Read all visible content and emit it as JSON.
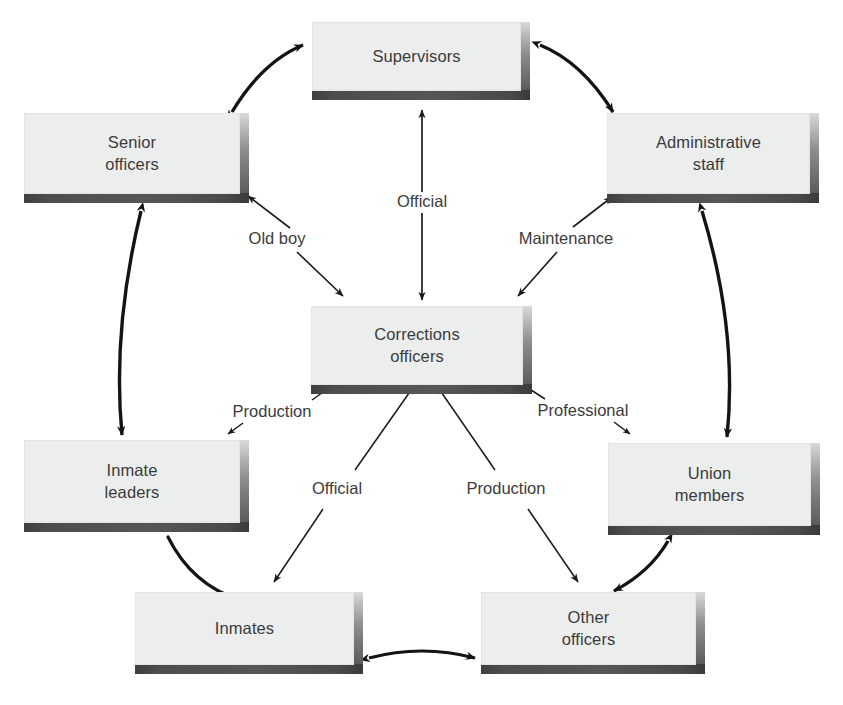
{
  "diagram": {
    "type": "network-diagram",
    "colors": {
      "box_face": "#eceded",
      "box_shadow": "#4a4a4a",
      "text": "#3b3b3b",
      "edge": "#141414",
      "background": "#ffffff"
    },
    "nodes": [
      {
        "id": "supervisors",
        "label": "Supervisors",
        "lines": [
          "Supervisors"
        ],
        "x": 312,
        "y": 22,
        "w": 218,
        "h": 78
      },
      {
        "id": "senior",
        "label": "Senior officers",
        "lines": [
          "Senior",
          "officers"
        ],
        "x": 24,
        "y": 113,
        "w": 225,
        "h": 90
      },
      {
        "id": "admin",
        "label": "Administrative staff",
        "lines": [
          "Administrative",
          "staff"
        ],
        "x": 607,
        "y": 113,
        "w": 212,
        "h": 90
      },
      {
        "id": "corrections",
        "label": "Corrections officers",
        "lines": [
          "Corrections",
          "officers"
        ],
        "x": 311,
        "y": 306,
        "w": 221,
        "h": 88
      },
      {
        "id": "inmateleaders",
        "label": "Inmate leaders",
        "lines": [
          "Inmate",
          "leaders"
        ],
        "x": 24,
        "y": 440,
        "w": 225,
        "h": 92
      },
      {
        "id": "union",
        "label": "Union members",
        "lines": [
          "Union",
          "members"
        ],
        "x": 608,
        "y": 443,
        "w": 212,
        "h": 92
      },
      {
        "id": "inmates",
        "label": "Inmates",
        "lines": [
          "Inmates"
        ],
        "x": 135,
        "y": 592,
        "w": 228,
        "h": 82
      },
      {
        "id": "otherofficers",
        "label": "Other officers",
        "lines": [
          "Other",
          "officers"
        ],
        "x": 481,
        "y": 592,
        "w": 224,
        "h": 82
      }
    ],
    "edge_labels": [
      {
        "id": "official-top",
        "text": "Official",
        "x": 422,
        "y": 201
      },
      {
        "id": "old-boy",
        "text": "Old boy",
        "x": 277,
        "y": 238
      },
      {
        "id": "maintenance",
        "text": "Maintenance",
        "x": 566,
        "y": 238
      },
      {
        "id": "production-left",
        "text": "Production",
        "x": 272,
        "y": 411
      },
      {
        "id": "professional",
        "text": "Professional",
        "x": 583,
        "y": 410
      },
      {
        "id": "official-bottom",
        "text": "Official",
        "x": 337,
        "y": 488
      },
      {
        "id": "production-bottom",
        "text": "Production",
        "x": 506,
        "y": 488
      }
    ],
    "edges": [
      {
        "id": "senior-supervisors",
        "from": "senior",
        "to": "supervisors",
        "style": "curved-double"
      },
      {
        "id": "supervisors-admin",
        "from": "supervisors",
        "to": "admin",
        "style": "curved-double"
      },
      {
        "id": "supervisors-corrections",
        "from": "supervisors",
        "to": "corrections",
        "style": "straight-double",
        "label": "Official"
      },
      {
        "id": "senior-corrections",
        "from": "senior",
        "to": "corrections",
        "style": "straight-double",
        "label": "Old boy"
      },
      {
        "id": "admin-corrections",
        "from": "admin",
        "to": "corrections",
        "style": "straight-double",
        "label": "Maintenance"
      },
      {
        "id": "senior-inmateleaders",
        "from": "senior",
        "to": "inmateleaders",
        "style": "curved-double"
      },
      {
        "id": "admin-union",
        "from": "admin",
        "to": "union",
        "style": "curved-double"
      },
      {
        "id": "inmateleaders-corrections",
        "from": "inmateleaders",
        "to": "corrections",
        "style": "straight-double",
        "label": "Production"
      },
      {
        "id": "union-corrections",
        "from": "union",
        "to": "corrections",
        "style": "straight-double",
        "label": "Professional"
      },
      {
        "id": "inmates-corrections",
        "from": "inmates",
        "to": "corrections",
        "style": "straight-double",
        "label": "Official"
      },
      {
        "id": "otherofficers-corrections",
        "from": "otherofficers",
        "to": "corrections",
        "style": "straight-double",
        "label": "Production"
      },
      {
        "id": "inmateleaders-inmates",
        "from": "inmateleaders",
        "to": "inmates",
        "style": "curved-plain"
      },
      {
        "id": "union-otherofficers",
        "from": "union",
        "to": "otherofficers",
        "style": "curved-double"
      },
      {
        "id": "inmates-otherofficers",
        "from": "inmates",
        "to": "otherofficers",
        "style": "curved-double"
      }
    ]
  }
}
